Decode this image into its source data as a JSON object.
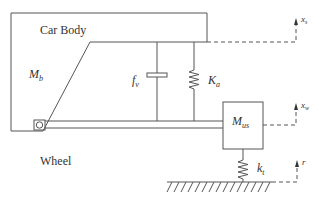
{
  "diagram": {
    "colors": {
      "stroke": "#555555",
      "text": "#333333",
      "background": "#ffffff"
    },
    "labels": {
      "car_body": "Car Body",
      "wheel": "Wheel",
      "body_mass": {
        "base": "M",
        "sub": "b"
      },
      "unsprung_mass": {
        "base": "M",
        "sub": "us"
      },
      "damper_force": {
        "base": "f",
        "sub": "v"
      },
      "suspension_spring": {
        "base": "K",
        "sub": "a"
      },
      "tire_spring": {
        "base": "k",
        "sub": "t"
      },
      "body_displacement": {
        "base": "x",
        "sub": "s"
      },
      "wheel_displacement": {
        "base": "x",
        "sub": "w"
      },
      "road_input": {
        "base": "r",
        "sub": ""
      }
    },
    "components": [
      "car-body-frame",
      "suspension-arm",
      "pivot-joint",
      "damper",
      "suspension-spring",
      "wheel-mass-block",
      "tire-spring",
      "ground",
      "displacement-arrows"
    ]
  }
}
